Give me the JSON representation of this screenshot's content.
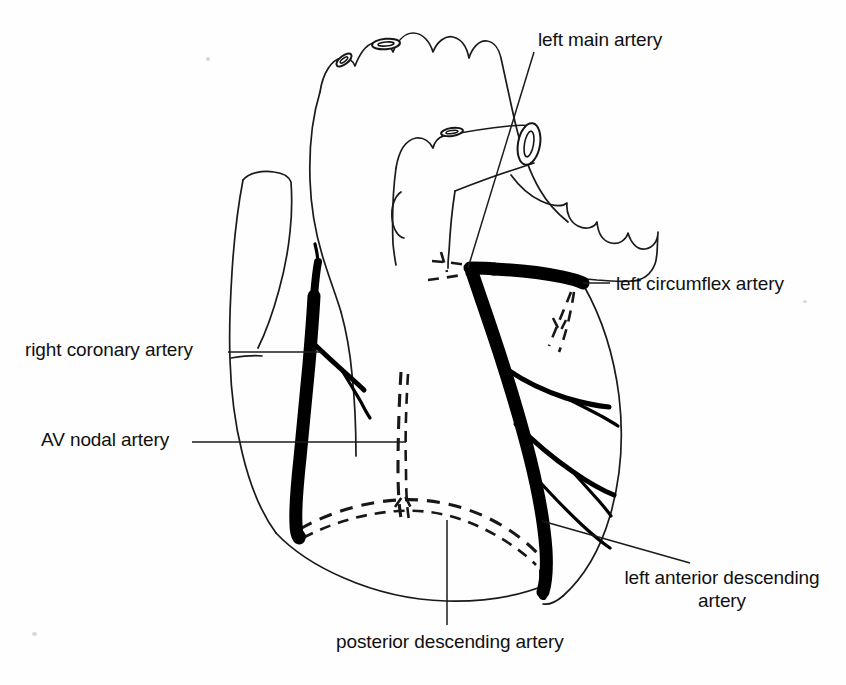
{
  "diagram": {
    "background_color": "#fefefe",
    "ink_color": "#111111",
    "vessel_color": "#000000"
  },
  "labels": [
    {
      "id": "left-main-artery",
      "text": "left main artery",
      "x": 538,
      "y": 28,
      "align": "left",
      "leader": "from text down-left to the left main coronary bifurcation"
    },
    {
      "id": "left-circumflex-artery",
      "text": "left circumflex artery",
      "x": 616,
      "y": 272,
      "align": "left",
      "leader": "horizontal line left to the circumflex trunk"
    },
    {
      "id": "right-coronary-artery",
      "text": "right coronary artery",
      "x": 25,
      "y": 338,
      "align": "left",
      "leader": "horizontal line right to the right coronary artery"
    },
    {
      "id": "av-nodal-artery",
      "text": "AV nodal artery",
      "x": 41,
      "y": 428,
      "align": "left",
      "leader": "long horizontal line right across the heart"
    },
    {
      "id": "left-anterior-descending-artery",
      "text": "left anterior descending\nartery",
      "line1": "left anterior descending",
      "line2": "artery",
      "x": 602,
      "y": 566,
      "align": "center",
      "leader": "diagonal line up-left to the LAD"
    },
    {
      "id": "posterior-descending-artery",
      "text": "posterior descending artery",
      "x": 336,
      "y": 630,
      "align": "left",
      "leader": "vertical line up to the dashed posterior descending artery"
    }
  ],
  "structures": [
    {
      "id": "aortic-arch",
      "name": "aortic arch",
      "style": "thin outline with scalloped superior border and three brachiocephalic branch stumps"
    },
    {
      "id": "superior-vena-cava",
      "name": "superior vena cava",
      "style": "thin outline, left upper region"
    },
    {
      "id": "right-atrium",
      "name": "right atrium",
      "style": "thin outline"
    },
    {
      "id": "right-ventricle",
      "name": "right ventricle",
      "style": "thin outline, central lower"
    },
    {
      "id": "left-ventricle",
      "name": "left ventricle",
      "style": "thin outline, right lower, rounded apex"
    },
    {
      "id": "pulmonary-artery",
      "name": "pulmonary artery",
      "style": "thin outline, cut cylinder with elliptical lumen upper right"
    },
    {
      "id": "left-atrial-appendage",
      "name": "left atrial appendage",
      "style": "scalloped thin outline right of pulmonary artery"
    }
  ],
  "vessels": [
    {
      "id": "left-main",
      "name": "left main artery",
      "render": "thick solid black",
      "hidden": false
    },
    {
      "id": "left-circumflex",
      "name": "left circumflex artery",
      "render": "thick solid black running horizontally in the AV groove",
      "hidden": false
    },
    {
      "id": "circumflex-hidden-branches",
      "name": "circumflex hidden branches",
      "render": "dashed",
      "hidden": true
    },
    {
      "id": "left-anterior-descending",
      "name": "left anterior descending artery",
      "render": "thick solid black descending to apex",
      "hidden": false
    },
    {
      "id": "diagonal-branches",
      "name": "diagonal branches",
      "render": "thin solid black, three branches to the left ventricle",
      "hidden": false
    },
    {
      "id": "right-coronary",
      "name": "right coronary artery",
      "render": "thick solid black along the right AV groove",
      "hidden": false
    },
    {
      "id": "acute-marginal-branch",
      "name": "acute marginal branch",
      "render": "medium solid black",
      "hidden": false
    },
    {
      "id": "posterior-descending",
      "name": "posterior descending artery",
      "render": "dashed, hidden behind heart",
      "hidden": true
    },
    {
      "id": "av-nodal",
      "name": "AV nodal artery",
      "render": "dashed, hidden behind heart",
      "hidden": true
    }
  ]
}
